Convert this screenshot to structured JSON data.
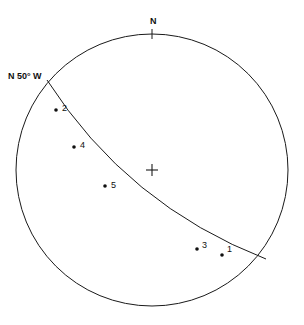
{
  "figure": {
    "name": "stereonet-plot",
    "background_color": "#ffffff",
    "line_color": "#1a1a1a",
    "dot_color": "#101010"
  },
  "labels": {
    "north": "N",
    "strike": "N 50° W"
  },
  "chart_data": {
    "type": "scatter",
    "title": "",
    "subtitle": "",
    "xlabel": "",
    "ylabel": "",
    "projection": "stereographic-lower-hemisphere",
    "grid": false,
    "legend": false,
    "primitive_circle": {
      "center_x": 152,
      "center_y": 170,
      "radius": 136
    },
    "center_marker": {
      "symbol": "+",
      "x": 152,
      "y": 170
    },
    "north_tick": {
      "label": "N",
      "x": 152,
      "y": 34,
      "label_x": 150,
      "label_y": 24
    },
    "great_circle": {
      "label": "N 50° W",
      "strike": "N 50° W",
      "start_x": 47,
      "start_y": 80,
      "end_x": 266,
      "end_y": 259,
      "label_x": 8,
      "label_y": 76
    },
    "points": [
      {
        "label": "2",
        "x": 56,
        "y": 110,
        "label_x": 62,
        "label_y": 108
      },
      {
        "label": "4",
        "x": 74,
        "y": 147,
        "label_x": 80,
        "label_y": 145
      },
      {
        "label": "5",
        "x": 105,
        "y": 186,
        "label_x": 111,
        "label_y": 185
      },
      {
        "label": "3",
        "x": 197,
        "y": 249,
        "label_x": 202,
        "label_y": 245
      },
      {
        "label": "1",
        "x": 222,
        "y": 255,
        "label_x": 227,
        "label_y": 249
      }
    ]
  }
}
